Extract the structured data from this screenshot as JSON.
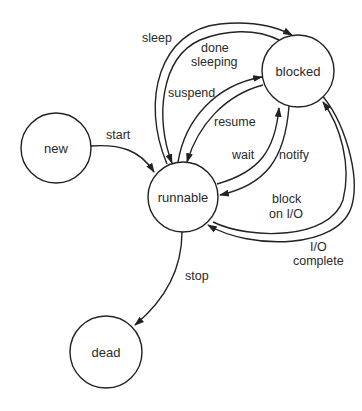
{
  "diagram": {
    "type": "state-transition",
    "states": [
      {
        "id": "new",
        "label": "new"
      },
      {
        "id": "runnable",
        "label": "runnable"
      },
      {
        "id": "blocked",
        "label": "blocked"
      },
      {
        "id": "dead",
        "label": "dead"
      }
    ],
    "transitions": [
      {
        "from": "new",
        "to": "runnable",
        "label": [
          "start"
        ]
      },
      {
        "from": "runnable",
        "to": "blocked",
        "label": [
          "sleep"
        ]
      },
      {
        "from": "blocked",
        "to": "runnable",
        "label": [
          "done",
          "sleeping"
        ]
      },
      {
        "from": "runnable",
        "to": "blocked",
        "label": [
          "suspend"
        ]
      },
      {
        "from": "blocked",
        "to": "runnable",
        "label": [
          "resume"
        ]
      },
      {
        "from": "runnable",
        "to": "blocked",
        "label": [
          "wait"
        ]
      },
      {
        "from": "blocked",
        "to": "runnable",
        "label": [
          "notify"
        ]
      },
      {
        "from": "runnable",
        "to": "blocked",
        "label": [
          "block",
          "on I/O"
        ]
      },
      {
        "from": "blocked",
        "to": "runnable",
        "label": [
          "I/O",
          "complete"
        ]
      },
      {
        "from": "runnable",
        "to": "dead",
        "label": [
          "stop"
        ]
      }
    ]
  },
  "colors": {
    "stroke": "#222222",
    "text": "#2a2a2a",
    "background": "#ffffff"
  }
}
